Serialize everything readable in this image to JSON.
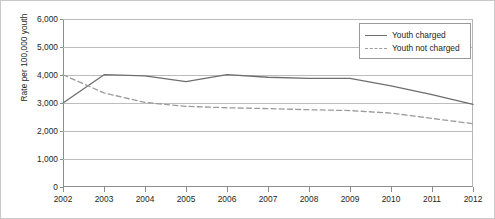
{
  "chart_data": {
    "type": "line",
    "title": "",
    "xlabel": "",
    "ylabel": "Rate per 100,000 youth",
    "categories": [
      "2002",
      "2003",
      "2004",
      "2005",
      "2006",
      "2007",
      "2008",
      "2009",
      "2010",
      "2011",
      "2012"
    ],
    "x": [
      2002,
      2003,
      2004,
      2005,
      2006,
      2007,
      2008,
      2009,
      2010,
      2011,
      2012
    ],
    "ylim": [
      0,
      6000
    ],
    "ytick_values": [
      0,
      1000,
      2000,
      3000,
      4000,
      5000,
      6000
    ],
    "ytick_labels": [
      "0",
      "1,000",
      "2,000",
      "3,000",
      "4,000",
      "5,000",
      "6,000"
    ],
    "grid": true,
    "legend_position": "top-right",
    "series": [
      {
        "name": "Youth charged",
        "style": "solid",
        "color": "#6e6e6e",
        "values": [
          3000,
          4010,
          3970,
          3760,
          4010,
          3920,
          3880,
          3880,
          3610,
          3300,
          2950
        ]
      },
      {
        "name": "Youth not charged",
        "style": "dashed",
        "color": "#9b9b9b",
        "values": [
          4010,
          3360,
          3020,
          2880,
          2830,
          2800,
          2760,
          2730,
          2640,
          2450,
          2260
        ]
      }
    ]
  },
  "legend": {
    "items": [
      {
        "label": "Youth charged"
      },
      {
        "label": "Youth not charged"
      }
    ]
  }
}
